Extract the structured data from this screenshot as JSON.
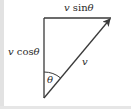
{
  "diagram": {
    "labels": {
      "top_component": {
        "var": "v",
        "fn": " sin",
        "angle": "θ"
      },
      "left_component": {
        "var": "v",
        "fn": " cos",
        "angle": "θ"
      },
      "hypotenuse": "v",
      "angle": "θ"
    },
    "colors": {
      "line": "#3a3a3a",
      "text": "#2a2a2a",
      "background": "#ffffff"
    }
  }
}
